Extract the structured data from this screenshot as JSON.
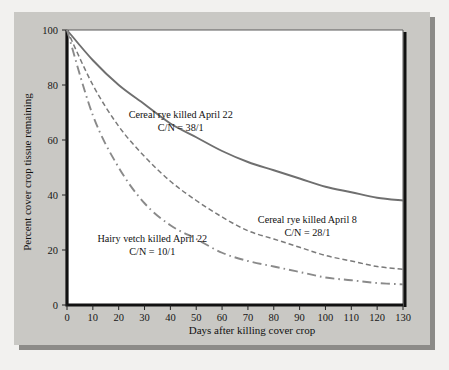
{
  "chart_data": {
    "type": "line",
    "title": "",
    "xlabel": "Days after killing cover crop",
    "ylabel": "Percent cover crop tissue remaining",
    "xlim": [
      0,
      130
    ],
    "ylim": [
      0,
      100
    ],
    "xticks": [
      0,
      10,
      20,
      30,
      40,
      50,
      60,
      70,
      80,
      90,
      100,
      110,
      120,
      130
    ],
    "yticks": [
      0,
      20,
      40,
      60,
      80,
      100
    ],
    "grid": false,
    "legend_position": "inline-annotations",
    "x": [
      0,
      10,
      20,
      30,
      40,
      50,
      60,
      70,
      80,
      90,
      100,
      110,
      120,
      130
    ],
    "series": [
      {
        "name": "Cereal rye killed April 22",
        "cn_ratio": "C/N = 38/1",
        "style": "solid",
        "color": "#6f6f6f",
        "values": [
          100,
          89,
          80,
          73,
          66,
          61,
          56,
          52,
          49,
          46,
          43,
          41,
          39,
          38
        ],
        "label_line1": "Cereal rye killed April 22",
        "label_line2": "C/N =  38/1",
        "label_x": 44,
        "label_y": 68
      },
      {
        "name": "Cereal rye killed April 8",
        "cn_ratio": "C/N = 28/1",
        "style": "dashed",
        "color": "#7a7a7a",
        "values": [
          100,
          80,
          65,
          54,
          45,
          38,
          32,
          27,
          24,
          21,
          18,
          16,
          14,
          13
        ],
        "label_line1": "Cereal rye killed April 8",
        "label_line2": "C/N =  28/1",
        "label_x": 93,
        "label_y": 30
      },
      {
        "name": "Hairy vetch killed April 22",
        "cn_ratio": "C/N = 10/1",
        "style": "dashdot",
        "color": "#8a8a8a",
        "values": [
          100,
          69,
          50,
          37,
          29,
          24,
          19,
          16,
          14,
          12,
          10,
          9,
          8,
          7.5
        ],
        "label_line1": "Hairy vetch killed April 22",
        "label_line2": "C/N =  10/1",
        "label_x": 33,
        "label_y": 23
      }
    ]
  }
}
